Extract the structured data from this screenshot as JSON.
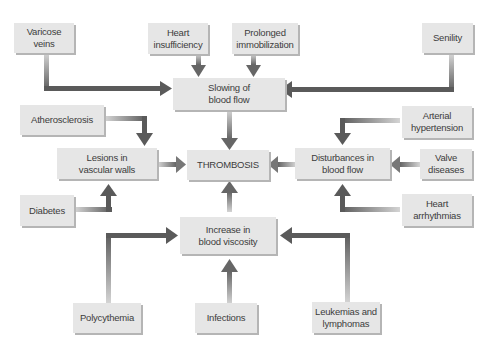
{
  "diagram": {
    "center": {
      "id": "thrombosis",
      "label": "THROMBOSIS"
    },
    "mechanisms": [
      {
        "id": "slowing",
        "label": "Slowing of\nblood flow"
      },
      {
        "id": "lesions",
        "label": "Lesions in\nvascular walls"
      },
      {
        "id": "disturbances",
        "label": "Disturbances in\nblood flow"
      },
      {
        "id": "viscosity",
        "label": "Increase in\nblood viscosity"
      }
    ],
    "causes": [
      {
        "id": "varicose",
        "label": "Varicose veins",
        "leads_to": "slowing"
      },
      {
        "id": "heart_insuff",
        "label": "Heart\ninsufficiency",
        "leads_to": "slowing"
      },
      {
        "id": "immobilization",
        "label": "Prolonged\nimmobilization",
        "leads_to": "slowing"
      },
      {
        "id": "senility",
        "label": "Senility",
        "leads_to": "slowing"
      },
      {
        "id": "atherosclerosis",
        "label": "Atherosclerosis",
        "leads_to": "lesions"
      },
      {
        "id": "diabetes",
        "label": "Diabetes",
        "leads_to": "lesions"
      },
      {
        "id": "hypertension",
        "label": "Arterial\nhypertension",
        "leads_to": "disturbances"
      },
      {
        "id": "valve",
        "label": "Valve\ndiseases",
        "leads_to": "disturbances"
      },
      {
        "id": "arrhythmias",
        "label": "Heart\narrhythmias",
        "leads_to": "disturbances"
      },
      {
        "id": "polycythemia",
        "label": "Polycythemia",
        "leads_to": "viscosity"
      },
      {
        "id": "infections",
        "label": "Infections",
        "leads_to": "viscosity"
      },
      {
        "id": "leukemias",
        "label": "Leukemias and\nlymphomas",
        "leads_to": "viscosity"
      }
    ],
    "colors": {
      "box_fill": "#e6e6e6",
      "box_shadow": "#b5b5b5",
      "text": "#3c3c3c",
      "arrow_dark": "#5a5a5a",
      "arrow_light": "#d0d0d0"
    }
  }
}
